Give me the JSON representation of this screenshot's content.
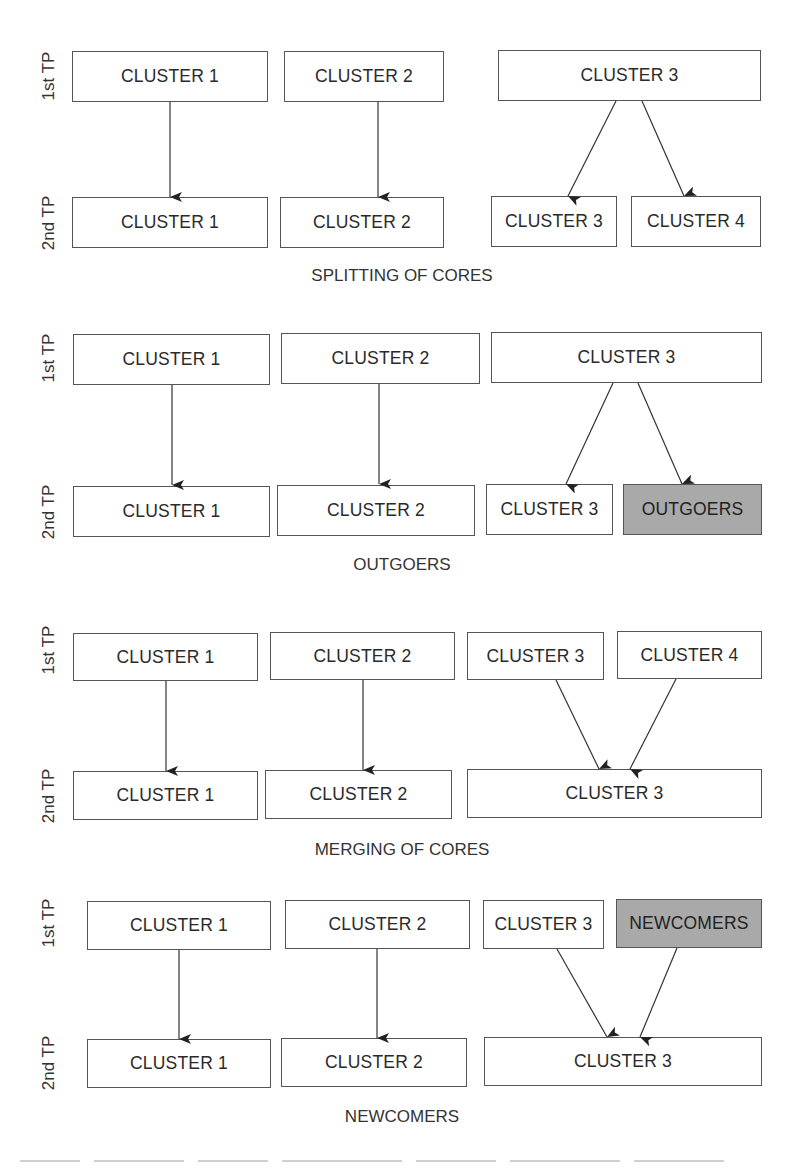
{
  "row_labels": {
    "first": "1st TP",
    "second": "2nd TP"
  },
  "colors": {
    "box_border": "#555555",
    "box_fill": "#ffffff",
    "shaded_fill": "#a9a9a9",
    "arrow": "#222222"
  },
  "panels": [
    {
      "caption": "SPLITTING OF CORES",
      "first_row": [
        {
          "label": "CLUSTER 1",
          "shaded": false
        },
        {
          "label": "CLUSTER 2",
          "shaded": false
        },
        {
          "label": "CLUSTER 3",
          "shaded": false
        }
      ],
      "second_row": [
        {
          "label": "CLUSTER 1",
          "shaded": false
        },
        {
          "label": "CLUSTER 2",
          "shaded": false
        },
        {
          "label": "CLUSTER 3",
          "shaded": false
        },
        {
          "label": "CLUSTER 4",
          "shaded": false
        }
      ],
      "edges": [
        [
          "CLUSTER 1",
          "CLUSTER 1"
        ],
        [
          "CLUSTER 2",
          "CLUSTER 2"
        ],
        [
          "CLUSTER 3",
          "CLUSTER 3"
        ],
        [
          "CLUSTER 3",
          "CLUSTER 4"
        ]
      ]
    },
    {
      "caption": "OUTGOERS",
      "first_row": [
        {
          "label": "CLUSTER 1",
          "shaded": false
        },
        {
          "label": "CLUSTER 2",
          "shaded": false
        },
        {
          "label": "CLUSTER 3",
          "shaded": false
        }
      ],
      "second_row": [
        {
          "label": "CLUSTER 1",
          "shaded": false
        },
        {
          "label": "CLUSTER 2",
          "shaded": false
        },
        {
          "label": "CLUSTER 3",
          "shaded": false
        },
        {
          "label": "OUTGOERS",
          "shaded": true
        }
      ],
      "edges": [
        [
          "CLUSTER 1",
          "CLUSTER 1"
        ],
        [
          "CLUSTER 2",
          "CLUSTER 2"
        ],
        [
          "CLUSTER 3",
          "CLUSTER 3"
        ],
        [
          "CLUSTER 3",
          "OUTGOERS"
        ]
      ]
    },
    {
      "caption": "MERGING OF CORES",
      "first_row": [
        {
          "label": "CLUSTER 1",
          "shaded": false
        },
        {
          "label": "CLUSTER 2",
          "shaded": false
        },
        {
          "label": "CLUSTER 3",
          "shaded": false
        },
        {
          "label": "CLUSTER 4",
          "shaded": false
        }
      ],
      "second_row": [
        {
          "label": "CLUSTER 1",
          "shaded": false
        },
        {
          "label": "CLUSTER 2",
          "shaded": false
        },
        {
          "label": "CLUSTER 3",
          "shaded": false
        }
      ],
      "edges": [
        [
          "CLUSTER 1",
          "CLUSTER 1"
        ],
        [
          "CLUSTER 2",
          "CLUSTER 2"
        ],
        [
          "CLUSTER 3",
          "CLUSTER 3"
        ],
        [
          "CLUSTER 4",
          "CLUSTER 3"
        ]
      ]
    },
    {
      "caption": "NEWCOMERS",
      "first_row": [
        {
          "label": "CLUSTER 1",
          "shaded": false
        },
        {
          "label": "CLUSTER 2",
          "shaded": false
        },
        {
          "label": "CLUSTER 3",
          "shaded": false
        },
        {
          "label": "NEWCOMERS",
          "shaded": true
        }
      ],
      "second_row": [
        {
          "label": "CLUSTER 1",
          "shaded": false
        },
        {
          "label": "CLUSTER 2",
          "shaded": false
        },
        {
          "label": "CLUSTER 3",
          "shaded": false
        }
      ],
      "edges": [
        [
          "CLUSTER 1",
          "CLUSTER 1"
        ],
        [
          "CLUSTER 2",
          "CLUSTER 2"
        ],
        [
          "CLUSTER 3",
          "CLUSTER 3"
        ],
        [
          "NEWCOMERS",
          "CLUSTER 3"
        ]
      ]
    }
  ]
}
